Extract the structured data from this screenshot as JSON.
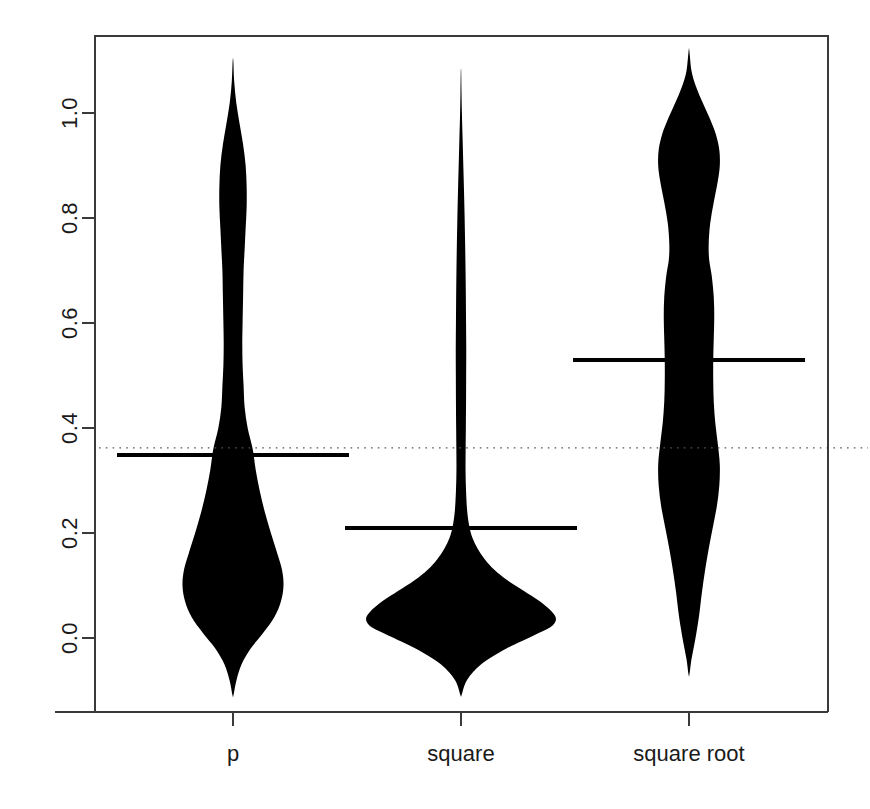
{
  "chart_data": {
    "type": "violin",
    "title": "",
    "subtitle": "",
    "xlabel": "",
    "ylabel": "",
    "categories": [
      "p",
      "square",
      "square root"
    ],
    "xtick_labels": [
      "p",
      "square",
      "square root"
    ],
    "ytick_labels": [
      "0.0",
      "0.2",
      "0.4",
      "0.6",
      "0.8",
      "1.0"
    ],
    "ytick_values": [
      0.0,
      0.2,
      0.4,
      0.6,
      0.8,
      1.0
    ],
    "ylim": [
      -0.16,
      1.19
    ],
    "grid": false,
    "legend": "none",
    "fill_color": "#000000",
    "reference_line": {
      "name": "horizontal dotted reference",
      "value": 0.362,
      "style": "dotted",
      "color": "#555555"
    },
    "series": [
      {
        "name": "p",
        "center_value": 0.349,
        "center_bar_label": "0.349",
        "min": -0.11,
        "max": 1.1,
        "density": [
          {
            "y": -0.11,
            "w": 0.004
          },
          {
            "y": -0.08,
            "w": 0.035
          },
          {
            "y": -0.05,
            "w": 0.085
          },
          {
            "y": -0.02,
            "w": 0.175
          },
          {
            "y": 0.01,
            "w": 0.3
          },
          {
            "y": 0.04,
            "w": 0.41
          },
          {
            "y": 0.07,
            "w": 0.475
          },
          {
            "y": 0.1,
            "w": 0.5
          },
          {
            "y": 0.13,
            "w": 0.485
          },
          {
            "y": 0.16,
            "w": 0.44
          },
          {
            "y": 0.2,
            "w": 0.375
          },
          {
            "y": 0.24,
            "w": 0.315
          },
          {
            "y": 0.28,
            "w": 0.265
          },
          {
            "y": 0.32,
            "w": 0.225
          },
          {
            "y": 0.36,
            "w": 0.195
          },
          {
            "y": 0.4,
            "w": 0.145
          },
          {
            "y": 0.44,
            "w": 0.115
          },
          {
            "y": 0.48,
            "w": 0.105
          },
          {
            "y": 0.52,
            "w": 0.095
          },
          {
            "y": 0.56,
            "w": 0.092
          },
          {
            "y": 0.6,
            "w": 0.095
          },
          {
            "y": 0.65,
            "w": 0.1
          },
          {
            "y": 0.7,
            "w": 0.105
          },
          {
            "y": 0.74,
            "w": 0.115
          },
          {
            "y": 0.78,
            "w": 0.125
          },
          {
            "y": 0.82,
            "w": 0.135
          },
          {
            "y": 0.86,
            "w": 0.135
          },
          {
            "y": 0.9,
            "w": 0.125
          },
          {
            "y": 0.94,
            "w": 0.1
          },
          {
            "y": 0.98,
            "w": 0.065
          },
          {
            "y": 1.02,
            "w": 0.032
          },
          {
            "y": 1.06,
            "w": 0.012
          },
          {
            "y": 1.1,
            "w": 0.003
          }
        ]
      },
      {
        "name": "square",
        "center_value": 0.209,
        "center_bar_label": "0.209",
        "min": -0.11,
        "max": 1.08,
        "density": [
          {
            "y": -0.11,
            "w": 0.004
          },
          {
            "y": -0.08,
            "w": 0.06
          },
          {
            "y": -0.05,
            "w": 0.2
          },
          {
            "y": -0.02,
            "w": 0.45
          },
          {
            "y": 0.005,
            "w": 0.72
          },
          {
            "y": 0.02,
            "w": 0.88
          },
          {
            "y": 0.035,
            "w": 0.94
          },
          {
            "y": 0.05,
            "w": 0.9
          },
          {
            "y": 0.07,
            "w": 0.78
          },
          {
            "y": 0.09,
            "w": 0.62
          },
          {
            "y": 0.11,
            "w": 0.46
          },
          {
            "y": 0.13,
            "w": 0.33
          },
          {
            "y": 0.15,
            "w": 0.235
          },
          {
            "y": 0.17,
            "w": 0.165
          },
          {
            "y": 0.19,
            "w": 0.115
          },
          {
            "y": 0.21,
            "w": 0.085
          },
          {
            "y": 0.24,
            "w": 0.062
          },
          {
            "y": 0.28,
            "w": 0.05
          },
          {
            "y": 0.32,
            "w": 0.045
          },
          {
            "y": 0.36,
            "w": 0.046
          },
          {
            "y": 0.4,
            "w": 0.048
          },
          {
            "y": 0.45,
            "w": 0.05
          },
          {
            "y": 0.5,
            "w": 0.051
          },
          {
            "y": 0.55,
            "w": 0.052
          },
          {
            "y": 0.6,
            "w": 0.05
          },
          {
            "y": 0.65,
            "w": 0.048
          },
          {
            "y": 0.7,
            "w": 0.045
          },
          {
            "y": 0.75,
            "w": 0.041
          },
          {
            "y": 0.8,
            "w": 0.036
          },
          {
            "y": 0.85,
            "w": 0.03
          },
          {
            "y": 0.9,
            "w": 0.023
          },
          {
            "y": 0.95,
            "w": 0.016
          },
          {
            "y": 1.0,
            "w": 0.009
          },
          {
            "y": 1.04,
            "w": 0.005
          },
          {
            "y": 1.08,
            "w": 0.002
          }
        ]
      },
      {
        "name": "square root",
        "center_value": 0.53,
        "center_bar_label": "0.530",
        "min": -0.07,
        "max": 1.12,
        "density": [
          {
            "y": -0.07,
            "w": 0.004
          },
          {
            "y": -0.04,
            "w": 0.025
          },
          {
            "y": -0.01,
            "w": 0.055
          },
          {
            "y": 0.02,
            "w": 0.082
          },
          {
            "y": 0.05,
            "w": 0.105
          },
          {
            "y": 0.09,
            "w": 0.13
          },
          {
            "y": 0.13,
            "w": 0.16
          },
          {
            "y": 0.17,
            "w": 0.195
          },
          {
            "y": 0.21,
            "w": 0.235
          },
          {
            "y": 0.25,
            "w": 0.275
          },
          {
            "y": 0.29,
            "w": 0.3
          },
          {
            "y": 0.33,
            "w": 0.305
          },
          {
            "y": 0.37,
            "w": 0.285
          },
          {
            "y": 0.41,
            "w": 0.26
          },
          {
            "y": 0.45,
            "w": 0.245
          },
          {
            "y": 0.49,
            "w": 0.24
          },
          {
            "y": 0.53,
            "w": 0.24
          },
          {
            "y": 0.57,
            "w": 0.245
          },
          {
            "y": 0.61,
            "w": 0.25
          },
          {
            "y": 0.65,
            "w": 0.245
          },
          {
            "y": 0.69,
            "w": 0.225
          },
          {
            "y": 0.72,
            "w": 0.2
          },
          {
            "y": 0.75,
            "w": 0.195
          },
          {
            "y": 0.79,
            "w": 0.21
          },
          {
            "y": 0.83,
            "w": 0.245
          },
          {
            "y": 0.87,
            "w": 0.285
          },
          {
            "y": 0.9,
            "w": 0.305
          },
          {
            "y": 0.93,
            "w": 0.3
          },
          {
            "y": 0.96,
            "w": 0.265
          },
          {
            "y": 0.99,
            "w": 0.205
          },
          {
            "y": 1.02,
            "w": 0.135
          },
          {
            "y": 1.05,
            "w": 0.07
          },
          {
            "y": 1.08,
            "w": 0.025
          },
          {
            "y": 1.12,
            "w": 0.003
          }
        ]
      }
    ]
  }
}
